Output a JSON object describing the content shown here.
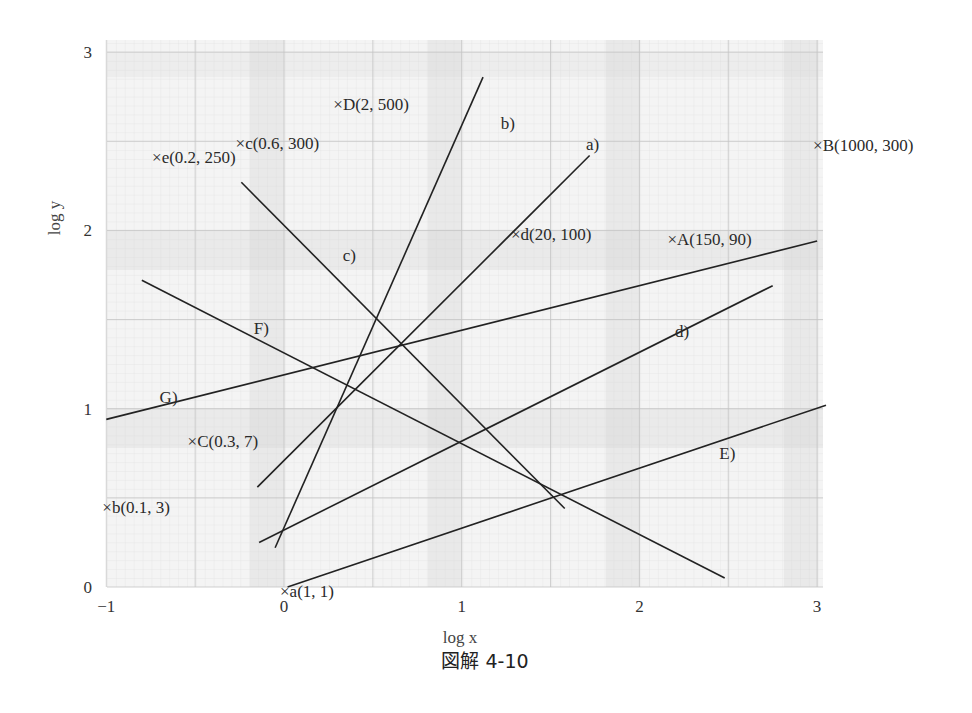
{
  "figure": {
    "caption": "図解 4-10",
    "xlabel": "log x",
    "ylabel": "log y"
  },
  "chart_data": {
    "type": "line",
    "title": "図解 4-10",
    "xlabel": "log x",
    "ylabel": "log y",
    "xlim": [
      -1,
      3
    ],
    "ylim": [
      0,
      3
    ],
    "grid": true,
    "x_ticks": [
      "−1",
      "0",
      "1",
      "2",
      "3"
    ],
    "y_ticks": [
      "0",
      "1",
      "2",
      "3"
    ],
    "series": [
      {
        "name": "a)",
        "points": [
          [
            -0.15,
            0.56
          ],
          [
            1.72,
            2.42
          ]
        ],
        "label_at": [
          1.7,
          2.45
        ]
      },
      {
        "name": "b)",
        "points": [
          [
            -0.05,
            0.22
          ],
          [
            1.12,
            2.86
          ]
        ],
        "label_at": [
          1.22,
          2.57
        ]
      },
      {
        "name": "c)",
        "points": [
          [
            -0.24,
            2.27
          ],
          [
            1.58,
            0.44
          ]
        ],
        "label_at": [
          0.33,
          1.83
        ]
      },
      {
        "name": "d)",
        "points": [
          [
            -0.14,
            0.25
          ],
          [
            2.75,
            1.69
          ]
        ],
        "label_at": [
          2.2,
          1.4
        ]
      },
      {
        "name": "E)",
        "points": [
          [
            0.02,
            0.0
          ],
          [
            3.05,
            1.02
          ]
        ],
        "label_at": [
          2.45,
          0.72
        ]
      },
      {
        "name": "F)",
        "points": [
          [
            -0.8,
            1.72
          ],
          [
            2.48,
            0.05
          ]
        ],
        "label_at": [
          -0.17,
          1.42
        ]
      },
      {
        "name": "G)",
        "points": [
          [
            -1.0,
            0.94
          ],
          [
            3.0,
            1.94
          ]
        ],
        "label_at": [
          -0.7,
          1.03
        ]
      }
    ],
    "points": [
      {
        "label": "×A(150, 90)",
        "x": 2.18,
        "y": 1.95
      },
      {
        "label": "×B(1000, 300)",
        "x": 3.0,
        "y": 2.48
      },
      {
        "label": "×C(0.3, 7)",
        "x": -0.52,
        "y": 0.82
      },
      {
        "label": "×D(2, 500)",
        "x": 0.3,
        "y": 2.71
      },
      {
        "label": "×a(1, 1)",
        "x": 0.0,
        "y": -0.02
      },
      {
        "label": "×b(0.1, 3)",
        "x": -1.0,
        "y": 0.45
      },
      {
        "label": "×c(0.6, 300)",
        "x": -0.25,
        "y": 2.49
      },
      {
        "label": "×d(20, 100)",
        "x": 1.3,
        "y": 1.98
      },
      {
        "label": "×e(0.2, 250)",
        "x": -0.72,
        "y": 2.41
      }
    ]
  }
}
